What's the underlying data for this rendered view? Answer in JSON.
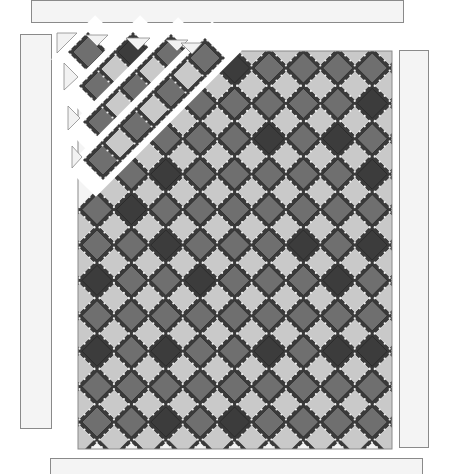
{
  "diagram": {
    "title": "",
    "type": "quilt-assembly-diagram",
    "layout": "blocks set on point with setting triangles, exploded diagonal rows at top-left corner, separate border strips",
    "colors": {
      "background": "#ffffff",
      "border_fill": "#f4f4f4",
      "border_stroke": "#8a8a8a",
      "setting_triangle_fill": "#f2f2f2",
      "sashing": "#3a3a3a",
      "sashing_triangle": "#f0f0f0",
      "dark_block": "#3c3c3c",
      "medium_block": "#6f6f6f",
      "light_block": "#c9c9c9"
    },
    "borders": {
      "top": {
        "x": 31,
        "y": 0,
        "w": 373,
        "h": 23
      },
      "left": {
        "x": 20,
        "y": 34,
        "w": 32,
        "h": 395
      },
      "right": {
        "x": 399,
        "y": 50,
        "w": 30,
        "h": 398
      },
      "bottom": {
        "x": 50,
        "y": 458,
        "w": 373,
        "h": 20
      }
    },
    "center": {
      "x": 78,
      "y": 51,
      "w": 314,
      "h": 398
    },
    "grid": {
      "columns": 9,
      "feature_rows": 11,
      "pitch_x": 34.4,
      "pitch_y": 35.4,
      "first_center_x": 97,
      "first_center_y": 68,
      "half_diagonal": 17
    },
    "dark_blocks": [
      [
        0,
        4
      ],
      [
        1,
        2
      ],
      [
        1,
        8
      ],
      [
        2,
        5
      ],
      [
        2,
        7
      ],
      [
        3,
        2
      ],
      [
        3,
        8
      ],
      [
        4,
        1
      ],
      [
        5,
        2
      ],
      [
        5,
        6
      ],
      [
        5,
        8
      ],
      [
        6,
        0
      ],
      [
        6,
        3
      ],
      [
        6,
        7
      ],
      [
        8,
        0
      ],
      [
        8,
        2
      ],
      [
        8,
        5
      ],
      [
        8,
        7
      ],
      [
        8,
        8
      ],
      [
        10,
        2
      ],
      [
        10,
        4
      ]
    ],
    "exploded_corner": {
      "rows": 4,
      "offset_step": 7
    }
  }
}
